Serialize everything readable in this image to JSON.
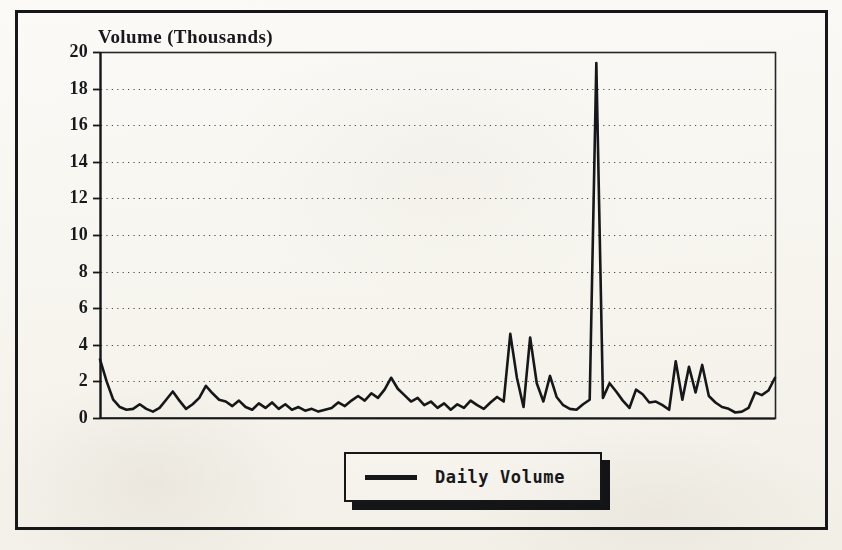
{
  "figure": {
    "background_color": "#fbfaf7",
    "frame_color": "#16171a"
  },
  "chart_data": {
    "type": "line",
    "title": "Volume (Thousands)",
    "xlabel": "",
    "ylabel": "Volume (Thousands)",
    "ylim": [
      0,
      20
    ],
    "xlim": [
      0,
      119
    ],
    "ytick_labels": [
      "0",
      "2",
      "4",
      "6",
      "8",
      "10",
      "12",
      "14",
      "16",
      "18",
      "20"
    ],
    "yticks": [
      0,
      2,
      4,
      6,
      8,
      10,
      12,
      14,
      16,
      18,
      20
    ],
    "xtick_labels": [],
    "grid": "horizontal-dotted",
    "legend_position": "below-center",
    "legend": [
      "Daily Volume"
    ],
    "line_color": "#16171a",
    "line_width": 2.6,
    "series": [
      {
        "name": "Daily Volume",
        "values": [
          3.2,
          2.0,
          1.0,
          0.6,
          0.45,
          0.5,
          0.75,
          0.5,
          0.35,
          0.55,
          1.0,
          1.45,
          0.95,
          0.5,
          0.75,
          1.1,
          1.75,
          1.35,
          1.0,
          0.9,
          0.65,
          0.95,
          0.6,
          0.45,
          0.8,
          0.55,
          0.85,
          0.5,
          0.75,
          0.45,
          0.6,
          0.4,
          0.5,
          0.35,
          0.45,
          0.55,
          0.85,
          0.65,
          0.95,
          1.2,
          0.95,
          1.35,
          1.1,
          1.55,
          2.2,
          1.6,
          1.25,
          0.9,
          1.1,
          0.7,
          0.9,
          0.55,
          0.8,
          0.45,
          0.75,
          0.55,
          0.95,
          0.7,
          0.5,
          0.85,
          1.15,
          0.9,
          4.6,
          2.2,
          0.6,
          4.4,
          1.9,
          0.9,
          2.3,
          1.15,
          0.7,
          0.5,
          0.45,
          0.75,
          1.0,
          19.4,
          1.1,
          1.9,
          1.45,
          0.95,
          0.55,
          1.55,
          1.3,
          0.85,
          0.9,
          0.7,
          0.45,
          3.1,
          1.0,
          2.8,
          1.4,
          2.9,
          1.2,
          0.85,
          0.6,
          0.5,
          0.3,
          0.35,
          0.55,
          1.4,
          1.25,
          1.5,
          2.2
        ]
      }
    ]
  },
  "title_text": "Volume (Thousands)",
  "legend": {
    "label": "Daily Volume",
    "swatch_name": "line-swatch"
  },
  "plot_area": {
    "left": 100,
    "top": 52,
    "right": 775,
    "bottom": 418
  }
}
